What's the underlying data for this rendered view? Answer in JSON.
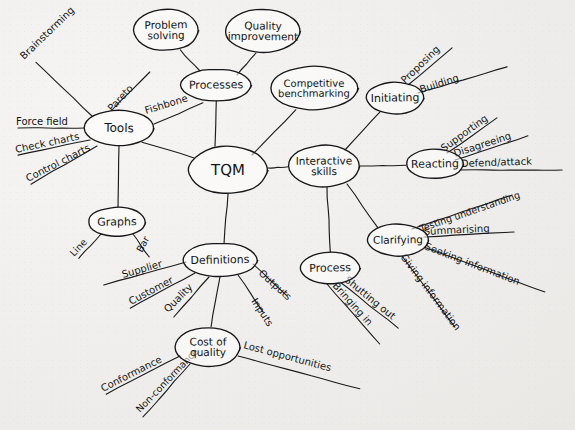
{
  "document": {
    "kind": "hand-drawn-mind-map",
    "medium": "pen on paper",
    "background_color": "#f1f0ee",
    "ink_color": "#141414"
  },
  "center": {
    "id": "tqm",
    "label": "TQM",
    "cx": 228,
    "cy": 170,
    "rx": 40,
    "ry": 24,
    "font_size": 15
  },
  "branches": [
    {
      "id": "tools",
      "label": "Tools",
      "cx": 119,
      "cy": 128,
      "rx": 35,
      "ry": 18,
      "font_size": 12,
      "leaves": [
        {
          "label": "Brainstorming",
          "x1": 92,
          "y1": 116,
          "x2": 36,
          "y2": 62,
          "tx": 24,
          "ty": 60,
          "rot": -44,
          "font_size": 10
        },
        {
          "label": "Pareto",
          "x1": 112,
          "y1": 110,
          "x2": 150,
          "y2": 72,
          "tx": 112,
          "ty": 112,
          "rot": -47,
          "font_size": 10
        },
        {
          "label": "Fishbone",
          "x1": 154,
          "y1": 124,
          "x2": 203,
          "y2": 103,
          "tx": 146,
          "ty": 114,
          "rot": -17,
          "font_size": 10
        },
        {
          "label": "Force field",
          "x1": 84,
          "y1": 128,
          "x2": 18,
          "y2": 128,
          "tx": 16,
          "ty": 125,
          "rot": 0,
          "font_size": 10
        },
        {
          "label": "Check charts",
          "x1": 90,
          "y1": 140,
          "x2": 18,
          "y2": 155,
          "tx": 16,
          "ty": 153,
          "rot": -12,
          "font_size": 10
        },
        {
          "label": "Control charts",
          "x1": 97,
          "y1": 146,
          "x2": 31,
          "y2": 184,
          "tx": 28,
          "ty": 182,
          "rot": -27,
          "font_size": 10
        }
      ]
    },
    {
      "id": "processes",
      "label": "Processes",
      "cx": 216,
      "cy": 85,
      "rx": 36,
      "ry": 16,
      "font_size": 11,
      "leaves": []
    },
    {
      "id": "problem-solving",
      "label": "Problem solving",
      "cx": 166,
      "cy": 30,
      "rx": 33,
      "ry": 21,
      "font_size": 10.5,
      "leaves": []
    },
    {
      "id": "quality-improvement",
      "label": "Quality improvement",
      "cx": 263,
      "cy": 31,
      "rx": 38,
      "ry": 22,
      "font_size": 10.5,
      "leaves": []
    },
    {
      "id": "competitive-benchmarking",
      "label": "Competitive benchmarking",
      "cx": 314,
      "cy": 88,
      "rx": 44,
      "ry": 22,
      "font_size": 10,
      "leaves": []
    },
    {
      "id": "graphs",
      "label": "Graphs",
      "cx": 117,
      "cy": 222,
      "rx": 29,
      "ry": 15,
      "font_size": 11,
      "leaves": [
        {
          "label": "Line",
          "x1": 101,
          "y1": 234,
          "x2": 79,
          "y2": 258,
          "tx": 74,
          "ty": 257,
          "rot": -47,
          "font_size": 9.5
        },
        {
          "label": "Bar",
          "x1": 133,
          "y1": 234,
          "x2": 149,
          "y2": 257,
          "tx": 142,
          "ty": 253,
          "rot": -62,
          "font_size": 9.5
        }
      ]
    },
    {
      "id": "definitions",
      "label": "Definitions",
      "cx": 220,
      "cy": 260,
      "rx": 38,
      "ry": 17,
      "font_size": 11,
      "leaves": [
        {
          "label": "Supplier",
          "x1": 186,
          "y1": 262,
          "x2": 104,
          "y2": 285,
          "tx": 123,
          "ty": 278,
          "rot": -16,
          "font_size": 10
        },
        {
          "label": "Customer",
          "x1": 195,
          "y1": 273,
          "x2": 130,
          "y2": 308,
          "tx": 131,
          "ty": 305,
          "rot": -28,
          "font_size": 10
        },
        {
          "label": "Quality",
          "x1": 209,
          "y1": 277,
          "x2": 174,
          "y2": 317,
          "tx": 168,
          "ty": 313,
          "rot": -45,
          "font_size": 10
        },
        {
          "label": "Inputs",
          "x1": 238,
          "y1": 275,
          "x2": 263,
          "y2": 312,
          "tx": 251,
          "ty": 301,
          "rot": 57,
          "font_size": 10
        },
        {
          "label": "Outputs",
          "x1": 253,
          "y1": 264,
          "x2": 287,
          "y2": 296,
          "tx": 258,
          "ty": 274,
          "rot": 42,
          "font_size": 10
        }
      ]
    },
    {
      "id": "cost-of-quality",
      "label": "Cost of quality",
      "cx": 208,
      "cy": 347,
      "rx": 33,
      "ry": 20,
      "font_size": 10.5,
      "leaves": [
        {
          "label": "Conformance",
          "x1": 180,
          "y1": 356,
          "x2": 106,
          "y2": 394,
          "tx": 103,
          "ty": 392,
          "rot": -27,
          "font_size": 10
        },
        {
          "label": "Non-conformance",
          "x1": 190,
          "y1": 364,
          "x2": 143,
          "y2": 417,
          "tx": 140,
          "ty": 413,
          "rot": -46,
          "font_size": 9.5
        },
        {
          "label": "Lost opportunities",
          "x1": 238,
          "y1": 356,
          "x2": 360,
          "y2": 389,
          "tx": 243,
          "ty": 348,
          "rot": 15,
          "font_size": 10
        }
      ]
    },
    {
      "id": "interactive-skills",
      "label": "Interactive skills",
      "cx": 324,
      "cy": 166,
      "rx": 36,
      "ry": 21,
      "font_size": 10.5,
      "leaves": []
    },
    {
      "id": "initiating",
      "label": "Initiating",
      "cx": 395,
      "cy": 98,
      "rx": 29,
      "ry": 16,
      "font_size": 11,
      "leaves": [
        {
          "label": "Proposing",
          "x1": 408,
          "y1": 85,
          "x2": 452,
          "y2": 48,
          "tx": 405,
          "ty": 84,
          "rot": -44,
          "font_size": 10
        },
        {
          "label": "Building",
          "x1": 418,
          "y1": 93,
          "x2": 507,
          "y2": 67,
          "tx": 421,
          "ty": 93,
          "rot": -18,
          "font_size": 10
        }
      ]
    },
    {
      "id": "reacting",
      "label": "Reacting",
      "cx": 435,
      "cy": 164,
      "rx": 29,
      "ry": 15,
      "font_size": 11,
      "leaves": [
        {
          "label": "Supporting",
          "x1": 447,
          "y1": 153,
          "x2": 497,
          "y2": 118,
          "tx": 444,
          "ty": 152,
          "rot": -36,
          "font_size": 10
        },
        {
          "label": "Disagreeing",
          "x1": 455,
          "y1": 160,
          "x2": 528,
          "y2": 136,
          "tx": 455,
          "ty": 157,
          "rot": -18,
          "font_size": 10
        },
        {
          "label": "Defend/attack",
          "x1": 460,
          "y1": 170,
          "x2": 562,
          "y2": 170,
          "tx": 461,
          "ty": 167,
          "rot": -2,
          "font_size": 10
        }
      ]
    },
    {
      "id": "clarifying",
      "label": "Clarifying",
      "cx": 398,
      "cy": 240,
      "rx": 31,
      "ry": 16,
      "font_size": 10.5,
      "leaves": [
        {
          "label": "Testing understanding",
          "x1": 412,
          "y1": 229,
          "x2": 512,
          "y2": 195,
          "tx": 421,
          "ty": 232,
          "rot": -19,
          "font_size": 9.5
        },
        {
          "label": "Summarising",
          "x1": 424,
          "y1": 237,
          "x2": 514,
          "y2": 232,
          "tx": 424,
          "ty": 235,
          "rot": -3,
          "font_size": 10
        },
        {
          "label": "Seeking information",
          "x1": 424,
          "y1": 247,
          "x2": 545,
          "y2": 292,
          "tx": 424,
          "ty": 249,
          "rot": 21,
          "font_size": 10
        },
        {
          "label": "Giving information",
          "x1": 402,
          "y1": 256,
          "x2": 455,
          "y2": 327,
          "tx": 400,
          "ty": 257,
          "rot": 53,
          "font_size": 10
        }
      ]
    },
    {
      "id": "process",
      "label": "Process",
      "cx": 330,
      "cy": 268,
      "rx": 30,
      "ry": 16,
      "font_size": 11,
      "leaves": [
        {
          "label": "Shutting out",
          "x1": 340,
          "y1": 282,
          "x2": 398,
          "y2": 328,
          "tx": 344,
          "ty": 281,
          "rot": 39,
          "font_size": 10
        },
        {
          "label": "Bringing in",
          "x1": 327,
          "y1": 284,
          "x2": 380,
          "y2": 344,
          "tx": 332,
          "ty": 286,
          "rot": 48,
          "font_size": 10
        }
      ]
    }
  ],
  "edges": [
    {
      "from": "tqm",
      "to": "tools",
      "x1": 194,
      "y1": 158,
      "x2": 142,
      "y2": 142
    },
    {
      "from": "tqm",
      "to": "processes",
      "x1": 215,
      "y1": 146,
      "x2": 216,
      "y2": 101
    },
    {
      "from": "tqm",
      "to": "graphs",
      "x1": 119,
      "y1": 146,
      "x2": 118,
      "y2": 207
    },
    {
      "from": "tqm",
      "to": "definitions",
      "x1": 228,
      "y1": 194,
      "x2": 224,
      "y2": 243
    },
    {
      "from": "tqm",
      "to": "interactive-skills",
      "x1": 268,
      "y1": 168,
      "x2": 288,
      "y2": 167
    },
    {
      "from": "tqm",
      "to": "competitive-benchmarking",
      "x1": 252,
      "y1": 155,
      "x2": 296,
      "y2": 110
    },
    {
      "from": "processes",
      "to": "problem-solving",
      "x1": 200,
      "y1": 71,
      "x2": 180,
      "y2": 50
    },
    {
      "from": "processes",
      "to": "quality-improvement",
      "x1": 237,
      "y1": 75,
      "x2": 256,
      "y2": 53
    },
    {
      "from": "definitions",
      "to": "cost-of-quality",
      "x1": 220,
      "y1": 277,
      "x2": 211,
      "y2": 327
    },
    {
      "from": "interactive-skills",
      "to": "initiating",
      "x1": 345,
      "y1": 150,
      "x2": 380,
      "y2": 112
    },
    {
      "from": "interactive-skills",
      "to": "reacting",
      "x1": 360,
      "y1": 166,
      "x2": 406,
      "y2": 165
    },
    {
      "from": "interactive-skills",
      "to": "clarifying",
      "x1": 347,
      "y1": 184,
      "x2": 378,
      "y2": 228
    },
    {
      "from": "interactive-skills",
      "to": "process",
      "x1": 327,
      "y1": 187,
      "x2": 330,
      "y2": 252
    }
  ]
}
